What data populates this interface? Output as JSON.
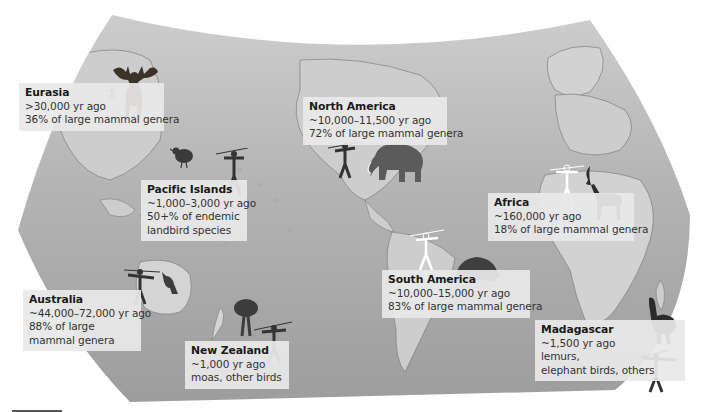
{
  "map": {
    "projection": "world map (curved projection), grayscale",
    "colors": {
      "ocean": "#a9a9a9",
      "land": "#cfcfcf",
      "label_bg": "#e8e8e8",
      "text": "#333333",
      "silhouette": "#3a3a3a"
    }
  },
  "regions": [
    {
      "id": "eurasia",
      "name": "Eurasia",
      "arrival": ">30,000 yr ago",
      "lines": [
        "36% of large mammal genera"
      ],
      "icons": [
        "human-figure",
        "giant-deer"
      ]
    },
    {
      "id": "north-america",
      "name": "North America",
      "arrival": "~10,000–11,500 yr ago",
      "lines": [
        "72% of large mammal genera"
      ],
      "icons": [
        "human-with-spear",
        "mammoth"
      ]
    },
    {
      "id": "pacific-islands",
      "name": "Pacific Islands",
      "arrival": "~1,000–3,000 yr ago",
      "lines": [
        "50+% of endemic",
        "landbird species"
      ],
      "icons": [
        "bird",
        "human-with-spear"
      ]
    },
    {
      "id": "africa",
      "name": "Africa",
      "arrival": "~160,000 yr ago",
      "lines": [
        "18% of large mammal genera"
      ],
      "icons": [
        "human-outline",
        "sable-antelope"
      ]
    },
    {
      "id": "australia",
      "name": "Australia",
      "arrival": "~44,000–72,000 yr ago",
      "lines": [
        "88% of large",
        "mammal genera"
      ],
      "icons": [
        "human-with-spear",
        "kangaroo"
      ]
    },
    {
      "id": "south-america",
      "name": "South America",
      "arrival": "~10,000–15,000 yr ago",
      "lines": [
        "83% of large mammal genera"
      ],
      "icons": [
        "human-outline",
        "glyptodon"
      ]
    },
    {
      "id": "new-zealand",
      "name": "New Zealand",
      "arrival": "~1,000 yr ago",
      "lines": [
        "moas, other birds"
      ],
      "icons": [
        "moa",
        "human-with-spear"
      ]
    },
    {
      "id": "madagascar",
      "name": "Madagascar",
      "arrival": "~1,500 yr ago",
      "lines": [
        "lemurs,",
        "elephant birds, others"
      ],
      "icons": [
        "elephant-bird",
        "human-with-spear"
      ]
    }
  ]
}
